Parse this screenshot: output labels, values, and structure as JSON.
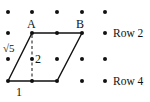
{
  "diagram": {
    "type": "geometry-dot-grid",
    "grid": {
      "columns_x": [
        8,
        32,
        57,
        82,
        105
      ],
      "rows_y": [
        12,
        33,
        59,
        81
      ],
      "dot_color": "#111111",
      "dot_radius": 2
    },
    "parallelogram": {
      "vertices": [
        [
          32,
          33
        ],
        [
          82,
          33
        ],
        [
          57,
          81
        ],
        [
          8,
          81
        ]
      ],
      "stroke": "#111111"
    },
    "height_line": {
      "from": [
        32,
        33
      ],
      "to": [
        32,
        81
      ],
      "style": "dashed"
    },
    "labels": {
      "vertex_a": "A",
      "vertex_b": "B",
      "side": "√5",
      "height": "2",
      "base": "1",
      "row2": "Row 2",
      "row4": "Row 4"
    }
  }
}
